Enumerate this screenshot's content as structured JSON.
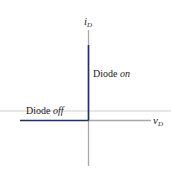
{
  "diagram": {
    "axes": {
      "y_label": {
        "main": "i",
        "sub": "D"
      },
      "x_label": {
        "main": "v",
        "sub": "D"
      }
    },
    "regions": {
      "on": {
        "prefix": "Diode ",
        "state": "on"
      },
      "off": {
        "prefix": "Diode ",
        "state": "off"
      }
    },
    "colors": {
      "axis": "#a8a8a8",
      "characteristic": "#1f2f6e",
      "text": "#222222"
    }
  }
}
